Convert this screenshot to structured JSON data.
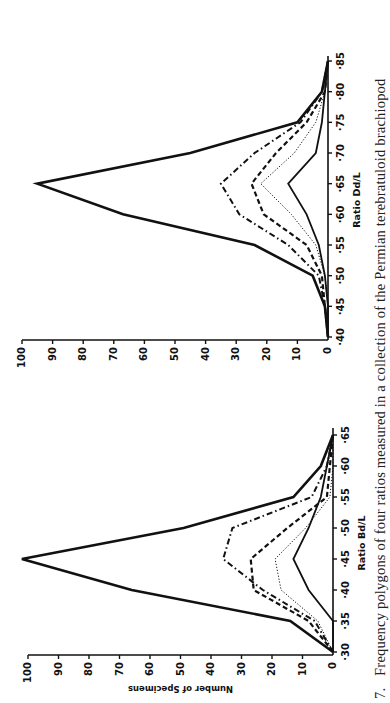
{
  "figure": {
    "caption_number": "7.",
    "caption_text": "Frequency polygons of four ratios measured in a collection of the Permian terebratuloid brachiopod"
  },
  "chart_data": [
    {
      "type": "line",
      "title": "",
      "xlabel": "Ratio Bd/L",
      "ylabel": "Number of Specimens",
      "x": [
        0.3,
        0.35,
        0.4,
        0.45,
        0.5,
        0.55,
        0.6,
        0.65
      ],
      "x_tick_labels": [
        "·30",
        "·35",
        "·40",
        "·45",
        "·50",
        "·55",
        "·60",
        "·65"
      ],
      "y_tick_labels": [
        "0",
        "10",
        "20",
        "30",
        "40",
        "50",
        "60",
        "70",
        "80",
        "90",
        "100"
      ],
      "ylim": [
        0,
        100
      ],
      "grid": false,
      "legend": "none",
      "orientation": "rotated -90 degrees on page",
      "series": [
        {
          "name": "total (heavy solid)",
          "style": "solid-heavy",
          "values": [
            0,
            14,
            66,
            102,
            49,
            13,
            4,
            0
          ]
        },
        {
          "name": "dash-dot",
          "style": "dash-dot",
          "values": [
            0,
            6,
            23,
            36,
            33,
            7,
            2,
            0
          ]
        },
        {
          "name": "dashed",
          "style": "dashed",
          "values": [
            0,
            8,
            26,
            27,
            15,
            2,
            1,
            0
          ]
        },
        {
          "name": "dotted",
          "style": "dotted",
          "values": [
            0,
            5,
            17,
            19,
            9,
            1,
            0,
            0
          ]
        },
        {
          "name": "thin solid",
          "style": "solid-thin",
          "values": [
            0,
            0,
            8,
            13,
            8,
            4,
            2,
            0
          ]
        }
      ]
    },
    {
      "type": "line",
      "title": "",
      "xlabel": "Ratio Dd/L",
      "ylabel": "",
      "x": [
        0.4,
        0.45,
        0.5,
        0.55,
        0.6,
        0.65,
        0.7,
        0.75,
        0.8,
        0.85
      ],
      "x_tick_labels": [
        "·40",
        "·45",
        "·50",
        "·55",
        "·60",
        "·65",
        "·70",
        "·75",
        "·80",
        "·85"
      ],
      "y_tick_labels": [
        "0",
        "10",
        "20",
        "30",
        "40",
        "50",
        "60",
        "70",
        "80",
        "90",
        "100"
      ],
      "ylim": [
        0,
        100
      ],
      "grid": false,
      "legend": "none",
      "orientation": "rotated -90 degrees on page",
      "series": [
        {
          "name": "total (heavy solid)",
          "style": "solid-heavy",
          "values": [
            0,
            1,
            5,
            24,
            67,
            95,
            45,
            10,
            2,
            0
          ]
        },
        {
          "name": "dash-dot",
          "style": "dash-dot",
          "values": [
            0,
            1,
            3,
            13,
            29,
            35,
            24,
            9,
            2,
            0
          ]
        },
        {
          "name": "dashed",
          "style": "dashed",
          "values": [
            0,
            1,
            2,
            7,
            21,
            25,
            17,
            7,
            1,
            0
          ]
        },
        {
          "name": "dotted",
          "style": "dotted",
          "values": [
            0,
            0,
            1,
            4,
            12,
            22,
            11,
            4,
            1,
            0
          ]
        },
        {
          "name": "thin solid",
          "style": "solid-thin",
          "values": [
            0,
            0,
            1,
            3,
            7,
            13,
            4,
            2,
            1,
            0
          ]
        }
      ]
    }
  ]
}
